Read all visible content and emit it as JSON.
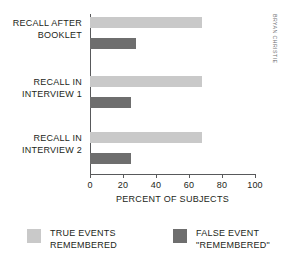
{
  "chart_data": {
    "type": "bar",
    "orientation": "horizontal",
    "title": "",
    "xlabel": "PERCENT OF SUBJECTS",
    "ylabel": "",
    "xlim": [
      0,
      100
    ],
    "xticks": [
      0,
      20,
      40,
      60,
      80,
      100
    ],
    "xtick_labels": [
      "0",
      "20",
      "40",
      "60",
      "80",
      "100"
    ],
    "grid": false,
    "categories": [
      "RECALL AFTER BOOKLET",
      "RECALL IN INTERVIEW 1",
      "RECALL IN INTERVIEW 2"
    ],
    "category_lines": [
      [
        "RECALL AFTER",
        "BOOKLET"
      ],
      [
        "RECALL IN",
        "INTERVIEW 1"
      ],
      [
        "RECALL IN",
        "INTERVIEW 2"
      ]
    ],
    "series": [
      {
        "name": "TRUE EVENTS REMEMBERED",
        "color": "#c9c9c9",
        "values": [
          68,
          68,
          68
        ]
      },
      {
        "name": "FALSE EVENT \"REMEMBERED\"",
        "color": "#6e6e6e",
        "values": [
          28,
          25,
          25
        ]
      }
    ],
    "legend": {
      "position": "bottom",
      "entries": [
        {
          "label": "TRUE EVENTS REMEMBERED",
          "line1": "TRUE EVENTS",
          "line2": "REMEMBERED",
          "color": "#c9c9c9"
        },
        {
          "label": "FALSE EVENT \"REMEMBERED\"",
          "line1": "FALSE EVENT",
          "line2": "\"REMEMBERED\"",
          "color": "#6e6e6e"
        }
      ]
    }
  },
  "credit": "BRYAN CHRISTIE",
  "colors": {
    "true_events": "#c9c9c9",
    "false_events": "#6e6e6e",
    "axis": "#58595b",
    "text": "#231f20",
    "background": "#ffffff"
  }
}
